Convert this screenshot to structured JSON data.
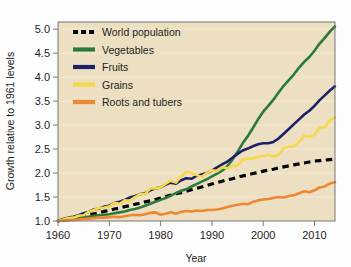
{
  "chart_data": {
    "type": "line",
    "title": "",
    "subtitle": "",
    "xlabel": "Year",
    "ylabel": "Growth relative to 1961 levels",
    "xlim": [
      1960,
      2014
    ],
    "ylim": [
      1.0,
      5.15
    ],
    "xticks": [
      1960,
      1970,
      1980,
      1990,
      2000,
      2010
    ],
    "xtick_labels": [
      "1960",
      "1970",
      "1980",
      "1990",
      "2000",
      "2010"
    ],
    "yticks": [
      1.0,
      1.5,
      2.0,
      2.5,
      3.0,
      3.5,
      4.0,
      4.5,
      5.0
    ],
    "ytick_labels": [
      "1.0",
      "1.5",
      "2.0",
      "2.5",
      "3.0",
      "3.5",
      "4.0",
      "4.5",
      "5.0"
    ],
    "grid": "horizontal",
    "grid_color": "#f4ead2",
    "plot_background": "#ecdfc2",
    "legend_position": "top-left",
    "x": [
      1960,
      1961,
      1962,
      1963,
      1964,
      1965,
      1966,
      1967,
      1968,
      1969,
      1970,
      1971,
      1972,
      1973,
      1974,
      1975,
      1976,
      1977,
      1978,
      1979,
      1980,
      1981,
      1982,
      1983,
      1984,
      1985,
      1986,
      1987,
      1988,
      1989,
      1990,
      1991,
      1992,
      1993,
      1994,
      1995,
      1996,
      1997,
      1998,
      1999,
      2000,
      2001,
      2002,
      2003,
      2004,
      2005,
      2006,
      2007,
      2008,
      2009,
      2010,
      2011,
      2012,
      2013,
      2014
    ],
    "series": [
      {
        "name": "World population",
        "color": "#000000",
        "style": "dashed",
        "values": [
          1.0,
          1.02,
          1.04,
          1.06,
          1.08,
          1.1,
          1.13,
          1.15,
          1.17,
          1.2,
          1.22,
          1.25,
          1.27,
          1.3,
          1.32,
          1.35,
          1.37,
          1.4,
          1.42,
          1.45,
          1.48,
          1.51,
          1.54,
          1.57,
          1.59,
          1.62,
          1.65,
          1.68,
          1.71,
          1.74,
          1.77,
          1.8,
          1.83,
          1.86,
          1.88,
          1.91,
          1.94,
          1.96,
          1.99,
          2.01,
          2.04,
          2.06,
          2.08,
          2.11,
          2.13,
          2.15,
          2.17,
          2.19,
          2.21,
          2.23,
          2.25,
          2.26,
          2.27,
          2.28,
          2.29
        ]
      },
      {
        "name": "Vegetables",
        "color": "#2b7a3d",
        "style": "solid",
        "values": [
          1.0,
          1.01,
          1.02,
          1.04,
          1.06,
          1.07,
          1.09,
          1.11,
          1.12,
          1.13,
          1.14,
          1.16,
          1.18,
          1.2,
          1.23,
          1.25,
          1.28,
          1.32,
          1.36,
          1.4,
          1.44,
          1.48,
          1.53,
          1.58,
          1.63,
          1.66,
          1.72,
          1.77,
          1.82,
          1.87,
          1.93,
          1.99,
          2.05,
          2.14,
          2.28,
          2.44,
          2.62,
          2.77,
          2.94,
          3.12,
          3.28,
          3.4,
          3.53,
          3.68,
          3.82,
          3.94,
          4.06,
          4.2,
          4.32,
          4.42,
          4.55,
          4.7,
          4.82,
          4.95,
          5.06
        ]
      },
      {
        "name": "Fruits",
        "color": "#1d2166",
        "style": "solid",
        "values": [
          1.0,
          1.04,
          1.07,
          1.09,
          1.12,
          1.16,
          1.19,
          1.24,
          1.26,
          1.3,
          1.32,
          1.38,
          1.4,
          1.44,
          1.49,
          1.52,
          1.56,
          1.58,
          1.64,
          1.68,
          1.7,
          1.76,
          1.8,
          1.78,
          1.85,
          1.89,
          1.88,
          1.94,
          1.97,
          2.0,
          2.05,
          2.12,
          2.18,
          2.24,
          2.32,
          2.4,
          2.47,
          2.51,
          2.56,
          2.6,
          2.62,
          2.62,
          2.65,
          2.72,
          2.82,
          2.92,
          3.02,
          3.12,
          3.22,
          3.3,
          3.4,
          3.52,
          3.62,
          3.72,
          3.81
        ]
      },
      {
        "name": "Grains",
        "color": "#f6d84c",
        "style": "solid",
        "values": [
          1.0,
          1.03,
          1.06,
          1.07,
          1.11,
          1.12,
          1.19,
          1.23,
          1.27,
          1.28,
          1.3,
          1.38,
          1.36,
          1.43,
          1.42,
          1.5,
          1.56,
          1.56,
          1.68,
          1.68,
          1.7,
          1.78,
          1.84,
          1.8,
          1.94,
          2.02,
          2.0,
          1.96,
          1.92,
          2.0,
          2.06,
          2.04,
          2.12,
          2.1,
          2.14,
          2.16,
          2.28,
          2.3,
          2.3,
          2.34,
          2.35,
          2.38,
          2.34,
          2.38,
          2.52,
          2.55,
          2.56,
          2.65,
          2.78,
          2.76,
          2.8,
          2.95,
          2.95,
          3.1,
          3.16
        ]
      },
      {
        "name": "Roots and tubers",
        "color": "#ee8733",
        "style": "solid",
        "values": [
          1.0,
          1.01,
          1.02,
          1.02,
          1.03,
          1.04,
          1.05,
          1.06,
          1.07,
          1.07,
          1.08,
          1.09,
          1.08,
          1.1,
          1.12,
          1.13,
          1.12,
          1.14,
          1.17,
          1.18,
          1.13,
          1.15,
          1.18,
          1.15,
          1.19,
          1.21,
          1.2,
          1.22,
          1.21,
          1.23,
          1.23,
          1.24,
          1.26,
          1.29,
          1.32,
          1.34,
          1.36,
          1.35,
          1.4,
          1.43,
          1.45,
          1.46,
          1.48,
          1.5,
          1.49,
          1.52,
          1.54,
          1.58,
          1.62,
          1.6,
          1.64,
          1.7,
          1.72,
          1.78,
          1.81
        ]
      }
    ]
  },
  "legend": {
    "items": [
      {
        "label": "World population"
      },
      {
        "label": "Vegetables"
      },
      {
        "label": "Fruits"
      },
      {
        "label": "Grains"
      },
      {
        "label": "Roots and tubers"
      }
    ]
  }
}
